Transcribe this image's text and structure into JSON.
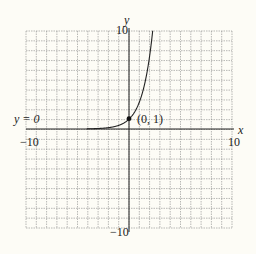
{
  "chart_data": {
    "type": "line",
    "title": "",
    "function": "y = e^x",
    "xlabel": "x",
    "ylabel": "y",
    "xlim": [
      -10,
      10
    ],
    "ylim": [
      -10,
      10
    ],
    "grid": true,
    "grid_step": 1,
    "tick_labels": {
      "x_min": "−10",
      "x_max": "10",
      "y_min": "−10",
      "y_max": "10"
    },
    "annotations": [
      {
        "text": "y = 0",
        "meaning": "horizontal asymptote"
      },
      {
        "text": "(0, 1)",
        "point": [
          0,
          1
        ]
      }
    ],
    "series": [
      {
        "name": "e^x",
        "x": [
          -10,
          -4,
          -2,
          -1,
          0,
          1,
          1.5,
          2,
          2.3
        ],
        "values": [
          5e-05,
          0.018,
          0.135,
          0.368,
          1,
          2.718,
          4.48,
          7.39,
          9.97
        ]
      }
    ]
  },
  "labels": {
    "x_axis": "x",
    "y_axis": "y",
    "x_min": "−10",
    "x_max": "10",
    "y_min": "−10",
    "y_max": "10",
    "asymptote": "y = 0",
    "point": "(0, 1)"
  }
}
